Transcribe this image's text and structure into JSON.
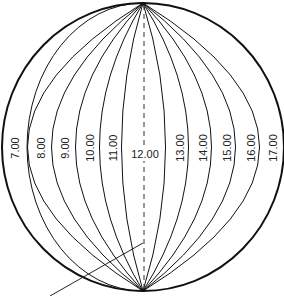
{
  "diagram": {
    "colors": {
      "stroke": "#111111",
      "text": "#222222",
      "background": "#ffffff"
    },
    "center_label": "12.00",
    "left_labels": [
      "7.00",
      "8.00",
      "9.00",
      "10.00",
      "11.00"
    ],
    "right_labels": [
      "13.00",
      "14.00",
      "15.00",
      "16.00",
      "17.00"
    ],
    "axis": "dashed vertical line through poles",
    "pointer": "leader line from lower-left pointing at axis"
  }
}
